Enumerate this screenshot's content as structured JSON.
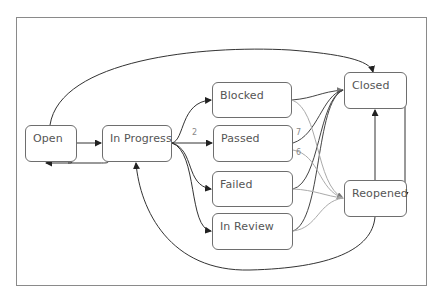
{
  "diagram": {
    "type": "state-transition",
    "nodes": [
      {
        "id": "open",
        "label": "Open",
        "x": 25,
        "y": 125,
        "w": 52,
        "h": 37
      },
      {
        "id": "in_progress",
        "label": "In Progress",
        "x": 102,
        "y": 125,
        "w": 70,
        "h": 37
      },
      {
        "id": "blocked",
        "label": "Blocked",
        "x": 212,
        "y": 82,
        "w": 80,
        "h": 36
      },
      {
        "id": "passed",
        "label": "Passed",
        "x": 213,
        "y": 125,
        "w": 80,
        "h": 37
      },
      {
        "id": "failed",
        "label": "Failed",
        "x": 212,
        "y": 171,
        "w": 81,
        "h": 36
      },
      {
        "id": "in_review",
        "label": "In Review",
        "x": 212,
        "y": 213,
        "w": 81,
        "h": 37
      },
      {
        "id": "closed",
        "label": "Closed",
        "x": 344,
        "y": 72,
        "w": 63,
        "h": 37
      },
      {
        "id": "reopened",
        "label": "Reopened",
        "x": 344,
        "y": 180,
        "w": 63,
        "h": 37
      }
    ],
    "edges": [
      {
        "from": "open",
        "to": "in_progress",
        "label": ""
      },
      {
        "from": "in_progress",
        "to": "open",
        "label": ""
      },
      {
        "from": "open",
        "to": "closed",
        "label": ""
      },
      {
        "from": "in_progress",
        "to": "blocked",
        "label": ""
      },
      {
        "from": "in_progress",
        "to": "passed",
        "label": "2"
      },
      {
        "from": "in_progress",
        "to": "failed",
        "label": ""
      },
      {
        "from": "in_progress",
        "to": "in_review",
        "label": ""
      },
      {
        "from": "blocked",
        "to": "closed",
        "label": ""
      },
      {
        "from": "blocked",
        "to": "reopened",
        "label": ""
      },
      {
        "from": "passed",
        "to": "closed",
        "label": "7"
      },
      {
        "from": "passed",
        "to": "reopened",
        "label": "6"
      },
      {
        "from": "failed",
        "to": "closed",
        "label": ""
      },
      {
        "from": "failed",
        "to": "reopened",
        "label": ""
      },
      {
        "from": "in_review",
        "to": "closed",
        "label": ""
      },
      {
        "from": "in_review",
        "to": "reopened",
        "label": ""
      },
      {
        "from": "closed",
        "to": "reopened",
        "label": ""
      },
      {
        "from": "reopened",
        "to": "closed",
        "label": ""
      },
      {
        "from": "reopened",
        "to": "in_progress",
        "label": ""
      }
    ],
    "edge_labels": {
      "in_progress_passed": "2",
      "passed_closed": "7",
      "passed_reopened": "6"
    },
    "colors": {
      "frame": "#8a8a8a",
      "node_border": "#6e6e6e",
      "node_text": "#555555",
      "edge_dark": "#333333",
      "edge_light": "#aaaaaa",
      "edge_label": "#888888"
    }
  }
}
